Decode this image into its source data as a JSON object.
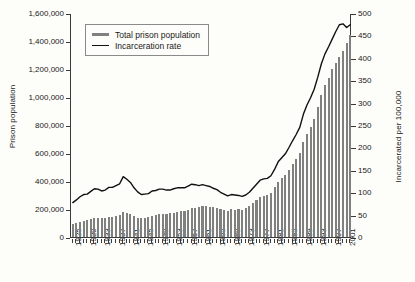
{
  "chart_data": {
    "type": "bar",
    "title": "",
    "subtitle": "",
    "xlabel": "",
    "ylabel": "Prison population",
    "y2label": "Incarcerated per 100,000",
    "ylim": [
      0,
      1600000
    ],
    "y2lim": [
      0,
      500
    ],
    "grid": false,
    "legend_position": "top-left",
    "y_ticks": [
      "0",
      "200,000",
      "400,000",
      "600,000",
      "800,000",
      "1,000,000",
      "1,200,000",
      "1,400,000",
      "1,600,000"
    ],
    "y_tick_values": [
      0,
      200000,
      400000,
      600000,
      800000,
      1000000,
      1200000,
      1400000,
      1600000
    ],
    "y2_ticks": [
      "0",
      "50",
      "100",
      "150",
      "200",
      "250",
      "300",
      "350",
      "400",
      "450",
      "500"
    ],
    "y2_tick_values": [
      0,
      50,
      100,
      150,
      200,
      250,
      300,
      350,
      400,
      450,
      500
    ],
    "x_tick_labels": [
      "1925",
      "1929",
      "1933",
      "1937",
      "1941",
      "1945",
      "1949",
      "1953",
      "1957",
      "1961",
      "1965",
      "1969",
      "1973",
      "1977",
      "1981",
      "1985",
      "1989",
      "1993",
      "1997",
      "2001"
    ],
    "x_tick_values": [
      1925,
      1929,
      1933,
      1937,
      1941,
      1945,
      1949,
      1953,
      1957,
      1961,
      1965,
      1969,
      1973,
      1977,
      1981,
      1985,
      1989,
      1993,
      1997,
      2001
    ],
    "x": [
      1925,
      1926,
      1927,
      1928,
      1929,
      1930,
      1931,
      1932,
      1933,
      1934,
      1935,
      1936,
      1937,
      1938,
      1939,
      1940,
      1941,
      1942,
      1943,
      1944,
      1945,
      1946,
      1947,
      1948,
      1949,
      1950,
      1951,
      1952,
      1953,
      1954,
      1955,
      1956,
      1957,
      1958,
      1959,
      1960,
      1961,
      1962,
      1963,
      1964,
      1965,
      1966,
      1967,
      1968,
      1969,
      1970,
      1971,
      1972,
      1973,
      1974,
      1975,
      1976,
      1977,
      1978,
      1979,
      1980,
      1981,
      1982,
      1983,
      1984,
      1985,
      1986,
      1987,
      1988,
      1989,
      1990,
      1991,
      1992,
      1993,
      1994,
      1995,
      1996,
      1997,
      1998,
      1999,
      2000,
      2001,
      2002
    ],
    "series": [
      {
        "name": "Total prison population",
        "axis": "left",
        "style": "bar",
        "color": "#808080",
        "values": [
          92000,
          97000,
          109000,
          116000,
          120000,
          129000,
          138000,
          137000,
          136000,
          138000,
          144000,
          146000,
          152000,
          159000,
          179000,
          174000,
          165000,
          150000,
          137000,
          133000,
          134000,
          141000,
          151000,
          155000,
          163000,
          166000,
          166000,
          169000,
          174000,
          182000,
          185000,
          189000,
          195000,
          206000,
          208000,
          213000,
          220000,
          218000,
          217000,
          214000,
          210000,
          200000,
          195000,
          188000,
          197000,
          196000,
          198000,
          196000,
          204000,
          218000,
          241000,
          263000,
          285000,
          295000,
          301000,
          316000,
          354000,
          395000,
          419000,
          443000,
          481000,
          522000,
          560000,
          603000,
          680000,
          739000,
          789000,
          846000,
          932000,
          1016000,
          1085000,
          1138000,
          1197000,
          1245000,
          1287000,
          1331000,
          1385000,
          1440000
        ]
      },
      {
        "name": "Incarceration rate",
        "axis": "right",
        "style": "line",
        "color": "#111111",
        "values": [
          79,
          85,
          92,
          97,
          98,
          104,
          110,
          109,
          105,
          107,
          113,
          113,
          117,
          121,
          137,
          131,
          124,
          112,
          103,
          97,
          98,
          99,
          105,
          106,
          109,
          109,
          107,
          107,
          110,
          112,
          112,
          112,
          116,
          120,
          119,
          117,
          119,
          117,
          115,
          111,
          108,
          102,
          98,
          94,
          97,
          96,
          95,
          93,
          96,
          102,
          111,
          120,
          129,
          132,
          133,
          139,
          153,
          170,
          179,
          188,
          202,
          217,
          231,
          247,
          276,
          297,
          313,
          332,
          359,
          389,
          411,
          427,
          444,
          461,
          476,
          478,
          470,
          476
        ]
      }
    ],
    "legend": [
      {
        "label": "Total prison population",
        "swatch": "bar"
      },
      {
        "label": "Incarceration rate",
        "swatch": "line"
      }
    ],
    "colors": {
      "bar": "#808080",
      "line": "#111111",
      "axis": "#3a3a3a",
      "background": "#fdfdf9",
      "text": "#1a1a1a",
      "legend_border": "#8a8a8a"
    }
  }
}
